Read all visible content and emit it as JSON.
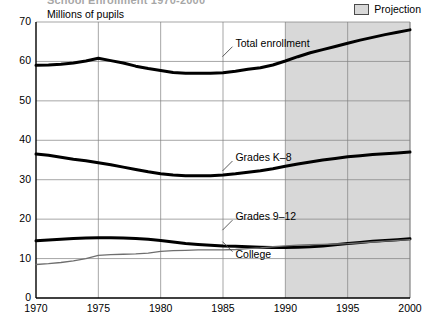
{
  "header": {
    "title_remnant": "School Enrollment 1970-2000",
    "axis_title": "Millions of pupils"
  },
  "legend": {
    "swatch_name": "projection-swatch",
    "label": "Projection",
    "swatch_color": "#d8d8d8"
  },
  "colors": {
    "line_dark": "#000000",
    "line_college": "#6e6e6e",
    "grid": "#808080",
    "axis": "#000000",
    "projection_fill": "#d8d8d8"
  },
  "chart_data": {
    "type": "line",
    "title": "School Enrollment 1970-2000",
    "xlabel": "",
    "ylabel": "Millions of pupils",
    "xlim": [
      1970,
      2000
    ],
    "ylim": [
      0,
      70
    ],
    "xticks": [
      1970,
      1975,
      1980,
      1985,
      1990,
      1995,
      2000
    ],
    "yticks": [
      0,
      10,
      20,
      30,
      40,
      50,
      60,
      70
    ],
    "grid": true,
    "legend_position": "top-right",
    "projection_start": 1990,
    "projection_end": 2000,
    "annotations": [
      {
        "text": "Total enrollment",
        "series": "Total enrollment",
        "x": 1986,
        "y": 64.5
      },
      {
        "text": "Grades K–8",
        "series": "Grades K–8",
        "x": 1986,
        "y": 35.5
      },
      {
        "text": "Grades 9–12",
        "series": "Grades 9–12",
        "x": 1986,
        "y": 20.5
      },
      {
        "text": "College",
        "series": "College",
        "x": 1986,
        "y": 11.0
      }
    ],
    "x": [
      1970,
      1971,
      1972,
      1973,
      1974,
      1975,
      1976,
      1977,
      1978,
      1979,
      1980,
      1981,
      1982,
      1983,
      1984,
      1985,
      1986,
      1987,
      1988,
      1989,
      1990,
      1991,
      1992,
      1993,
      1994,
      1995,
      1996,
      1997,
      1998,
      1999,
      2000
    ],
    "series": [
      {
        "name": "Total enrollment",
        "style": "thick-black",
        "values": [
          59.0,
          59.1,
          59.3,
          59.6,
          60.1,
          60.8,
          60.2,
          59.6,
          58.8,
          58.2,
          57.7,
          57.2,
          57.0,
          57.0,
          57.0,
          57.1,
          57.5,
          58.0,
          58.4,
          59.1,
          60.1,
          61.2,
          62.2,
          63.0,
          63.8,
          64.6,
          65.4,
          66.1,
          66.8,
          67.4,
          68.0
        ]
      },
      {
        "name": "Grades K–8",
        "style": "thick-black",
        "values": [
          36.5,
          36.2,
          35.7,
          35.2,
          34.8,
          34.3,
          33.8,
          33.2,
          32.6,
          32.0,
          31.5,
          31.2,
          31.0,
          31.0,
          31.0,
          31.2,
          31.5,
          31.9,
          32.3,
          32.8,
          33.4,
          34.0,
          34.5,
          35.0,
          35.4,
          35.8,
          36.1,
          36.4,
          36.6,
          36.8,
          37.0
        ]
      },
      {
        "name": "Grades 9–12",
        "style": "thick-black",
        "values": [
          14.5,
          14.7,
          14.9,
          15.1,
          15.2,
          15.3,
          15.3,
          15.2,
          15.1,
          14.9,
          14.6,
          14.2,
          13.8,
          13.6,
          13.4,
          13.2,
          13.1,
          13.0,
          12.9,
          12.8,
          12.8,
          12.9,
          13.0,
          13.2,
          13.5,
          13.8,
          14.1,
          14.4,
          14.6,
          14.8,
          15.0
        ]
      },
      {
        "name": "College",
        "style": "thin-gray",
        "values": [
          8.5,
          8.7,
          9.0,
          9.4,
          10.0,
          10.8,
          11.0,
          11.1,
          11.2,
          11.4,
          11.8,
          12.0,
          12.1,
          12.2,
          12.2,
          12.2,
          12.3,
          12.5,
          12.7,
          13.0,
          13.2,
          13.4,
          13.5,
          13.6,
          13.7,
          13.8,
          14.0,
          14.2,
          14.4,
          14.6,
          14.8
        ]
      }
    ]
  }
}
